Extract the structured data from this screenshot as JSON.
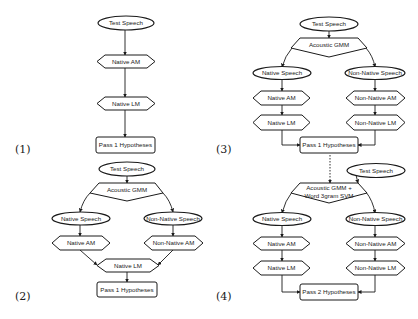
{
  "figure": {
    "panels": [
      {
        "label": "(1)",
        "nodes": {
          "test_speech": "Test Speech",
          "native_am": "Native AM",
          "native_lm": "Native LM",
          "hypotheses": "Pass 1 Hypotheses"
        }
      },
      {
        "label": "(2)",
        "nodes": {
          "test_speech": "Test Speech",
          "classifier": "Acoustic GMM",
          "native_speech": "Native Speech",
          "nonnative_speech": "Non-Native Speech",
          "native_am": "Native AM",
          "nonnative_am": "Non-Native AM",
          "native_lm": "Native LM",
          "hypotheses": "Pass 1 Hypotheses"
        }
      },
      {
        "label": "(3)",
        "nodes": {
          "test_speech": "Test Speech",
          "classifier": "Acoustic GMM",
          "native_speech": "Native Speech",
          "nonnative_speech": "Non-Native Speech",
          "native_am": "Native AM",
          "nonnative_am": "Non-Native AM",
          "native_lm": "Native LM",
          "nonnative_lm": "Non-Native LM",
          "hypotheses": "Pass 1 Hypotheses"
        }
      },
      {
        "label": "(4)",
        "nodes": {
          "test_speech": "Test Speech",
          "classifier_line1": "Acoustic GMM +",
          "classifier_line2": "Word 3gram SVM",
          "native_speech": "Native Speech",
          "nonnative_speech": "Non-Native Speech",
          "native_am": "Native AM",
          "nonnative_am": "Non-Native AM",
          "native_lm": "Native LM",
          "nonnative_lm": "Non-Native LM",
          "hypotheses": "Pass 2 Hypotheses"
        }
      }
    ]
  }
}
